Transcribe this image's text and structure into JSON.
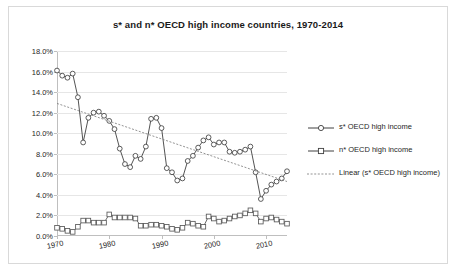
{
  "chart_data": {
    "type": "line",
    "title": "s* and n* OECD high income countries, 1970-2014",
    "xlabel": "",
    "ylabel": "",
    "xlim": [
      1970,
      2014
    ],
    "ylim": [
      0,
      18
    ],
    "yticks": [
      "0.0%",
      "2.0%",
      "4.0%",
      "6.0%",
      "8.0%",
      "10.0%",
      "12.0%",
      "14.0%",
      "16.0%",
      "18.0%"
    ],
    "ytick_values": [
      0,
      2,
      4,
      6,
      8,
      10,
      12,
      14,
      16,
      18
    ],
    "xticks": [
      "1970",
      "1980",
      "1990",
      "2000",
      "2010"
    ],
    "xtick_values": [
      1970,
      1980,
      1990,
      2000,
      2010
    ],
    "grid": true,
    "legend_position": "right",
    "x": [
      1970,
      1971,
      1972,
      1973,
      1974,
      1975,
      1976,
      1977,
      1978,
      1979,
      1980,
      1981,
      1982,
      1983,
      1984,
      1985,
      1986,
      1987,
      1988,
      1989,
      1990,
      1991,
      1992,
      1993,
      1994,
      1995,
      1996,
      1997,
      1998,
      1999,
      2000,
      2001,
      2002,
      2003,
      2004,
      2005,
      2006,
      2007,
      2008,
      2009,
      2010,
      2011,
      2012,
      2013,
      2014
    ],
    "series": [
      {
        "name": "s* OECD high income",
        "marker": "circle",
        "linestyle": "solid",
        "color": "#404040",
        "values": [
          16.1,
          15.6,
          15.4,
          15.8,
          13.5,
          9.1,
          11.5,
          12.0,
          12.1,
          11.7,
          11.2,
          10.4,
          8.5,
          7.0,
          6.7,
          7.8,
          7.5,
          8.7,
          11.4,
          11.5,
          10.5,
          6.6,
          6.2,
          5.4,
          5.6,
          7.3,
          7.8,
          8.6,
          9.3,
          9.6,
          8.9,
          9.1,
          9.1,
          8.2,
          8.1,
          8.2,
          8.4,
          8.7,
          6.2,
          3.6,
          4.4,
          5.0,
          5.3,
          5.6,
          6.3
        ]
      },
      {
        "name": "n* OECD high income",
        "marker": "square",
        "linestyle": "solid",
        "color": "#595959",
        "values": [
          0.8,
          0.7,
          0.5,
          0.4,
          0.9,
          1.5,
          1.5,
          1.3,
          1.3,
          1.3,
          2.1,
          1.8,
          1.8,
          1.8,
          1.8,
          1.7,
          1.0,
          1.0,
          1.1,
          1.1,
          1.0,
          0.9,
          0.7,
          0.6,
          0.8,
          1.3,
          1.2,
          1.0,
          0.9,
          1.9,
          1.7,
          1.4,
          1.5,
          1.7,
          1.9,
          2.0,
          2.2,
          2.5,
          2.2,
          1.4,
          1.7,
          1.8,
          1.6,
          1.4,
          1.2
        ]
      }
    ],
    "trendline": {
      "name": "Linear (s* OECD high income)",
      "linestyle": "dotted",
      "color": "#808080",
      "x_start": 1970,
      "y_start": 12.9,
      "x_end": 2014,
      "y_end": 5.3
    }
  },
  "legend": {
    "items": [
      {
        "label": "s* OECD high income",
        "marker": "circle",
        "style": "solid"
      },
      {
        "label": "n* OECD high income",
        "marker": "square",
        "style": "solid"
      },
      {
        "label": "Linear (s* OECD high income)",
        "marker": "none",
        "style": "dotted"
      }
    ]
  }
}
